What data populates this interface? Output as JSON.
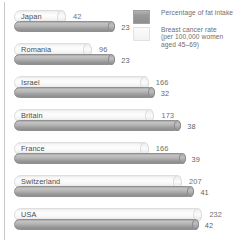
{
  "legend": {
    "items": [
      {
        "key": "fat",
        "swatch": "dark",
        "swatch_color": "#9a9a9a",
        "lines": [
          "Percentage of fat intake"
        ]
      },
      {
        "key": "rate",
        "swatch": "light",
        "swatch_color": "#f2f2f2",
        "lines": [
          "Breast cancer rate",
          "(per 100,000 women",
          "aged 45–69)"
        ]
      }
    ]
  },
  "chart_data": {
    "type": "bar",
    "orientation": "horizontal",
    "title": "",
    "xlabel": "",
    "ylabel": "",
    "grid": false,
    "legend_position": "top-right",
    "categories": [
      "Japan",
      "Romania",
      "Israel",
      "Britain",
      "France",
      "Switzerland",
      "USA"
    ],
    "series": [
      {
        "name": "Breast cancer rate (per 100,000 women aged 45–69)",
        "key": "rate",
        "color": "#f2f2f2",
        "values": [
          42,
          96,
          166,
          173,
          166,
          207,
          232
        ]
      },
      {
        "name": "Percentage of fat intake",
        "key": "fat",
        "color": "#9a9a9a",
        "values": [
          23,
          23,
          32,
          38,
          39,
          41,
          42
        ]
      }
    ],
    "xlim": [
      0,
      232
    ]
  }
}
